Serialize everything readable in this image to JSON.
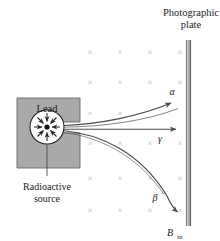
{
  "figure": {
    "type": "physics-schematic"
  },
  "labels": {
    "plate_line1": "Photographic",
    "plate_line2": "plate",
    "lead": "Lead",
    "source_line1": "Radioactive",
    "source_line2": "source",
    "alpha": "α",
    "gamma": "γ",
    "beta": "β",
    "beta_sup": "−",
    "bfield": "B",
    "bfield_sub": "in",
    "field_mark": "×"
  },
  "colors": {
    "ink": "#1b1b1b",
    "lead_fill": "#a9a9a9",
    "lead_stroke": "#5a5a5a",
    "plate_light": "#bdbdbd",
    "plate_dark": "#6e6e6e",
    "field_mark": "#b5b5b5",
    "ray": "#4a4a4a",
    "source_dot": "#111111",
    "circle_fill": "#ffffff"
  },
  "field_grid": {
    "symbol": "×",
    "columns_x": [
      90,
      120,
      150,
      180
    ],
    "rows_y": [
      52,
      82,
      113,
      143,
      178,
      210
    ],
    "marks": [
      {
        "x": 90,
        "y": 52
      },
      {
        "x": 120,
        "y": 52
      },
      {
        "x": 150,
        "y": 52
      },
      {
        "x": 180,
        "y": 52
      },
      {
        "x": 90,
        "y": 82
      },
      {
        "x": 120,
        "y": 82
      },
      {
        "x": 150,
        "y": 82
      },
      {
        "x": 180,
        "y": 82
      },
      {
        "x": 90,
        "y": 113
      },
      {
        "x": 120,
        "y": 113
      },
      {
        "x": 90,
        "y": 143
      },
      {
        "x": 120,
        "y": 143
      },
      {
        "x": 150,
        "y": 143
      },
      {
        "x": 180,
        "y": 143
      },
      {
        "x": 90,
        "y": 178
      },
      {
        "x": 120,
        "y": 178
      },
      {
        "x": 150,
        "y": 178
      },
      {
        "x": 180,
        "y": 178
      },
      {
        "x": 90,
        "y": 210
      },
      {
        "x": 120,
        "y": 210
      },
      {
        "x": 150,
        "y": 210
      },
      {
        "x": 180,
        "y": 210
      }
    ]
  },
  "rays": [
    {
      "name": "alpha",
      "label": "α",
      "curvature": "up",
      "deflection": "upward"
    },
    {
      "name": "gamma",
      "label": "γ",
      "curvature": "none",
      "deflection": "undeflected"
    },
    {
      "name": "beta",
      "label": "β−",
      "curvature": "down",
      "deflection": "downward"
    }
  ],
  "geometry": {
    "lead_block": {
      "x": 17,
      "y": 98,
      "width": 63,
      "height": 70
    },
    "collimator_slot": {
      "x": 62,
      "y": 122,
      "width": 20,
      "height": 11
    },
    "source_circle": {
      "cx": 47,
      "cy": 127,
      "r": 17
    },
    "plate": {
      "x": 186,
      "y": 40,
      "width": 5,
      "height": 186
    }
  }
}
